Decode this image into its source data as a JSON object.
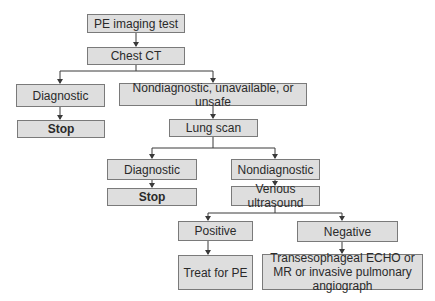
{
  "diagram": {
    "colors": {
      "box_fill": "#dedede",
      "box_border": "#7a7a7a",
      "line": "#3a3a3a",
      "text": "#2a2a2a"
    },
    "nodes": {
      "pe_imaging_test": "PE imaging test",
      "chest_ct": "Chest CT",
      "ct_diagnostic": "Diagnostic",
      "ct_nondiagnostic": "Nondiagnostic, unavailable, or unsafe",
      "ct_stop": "Stop",
      "lung_scan": "Lung scan",
      "ls_diagnostic": "Diagnostic",
      "ls_nondiagnostic": "Nondiagnostic",
      "ls_stop": "Stop",
      "venous_ultrasound": "Venous ultrasound",
      "vu_positive": "Positive",
      "vu_negative": "Negative",
      "treat_for_pe": "Treat for PE",
      "further_imaging": "Transesophageal ECHO or MR or invasive pulmonary angiograph"
    },
    "edges": [
      [
        "pe_imaging_test",
        "chest_ct"
      ],
      [
        "chest_ct",
        "ct_diagnostic"
      ],
      [
        "chest_ct",
        "ct_nondiagnostic"
      ],
      [
        "ct_diagnostic",
        "ct_stop"
      ],
      [
        "ct_nondiagnostic",
        "lung_scan"
      ],
      [
        "lung_scan",
        "ls_diagnostic"
      ],
      [
        "lung_scan",
        "ls_nondiagnostic"
      ],
      [
        "ls_diagnostic",
        "ls_stop"
      ],
      [
        "ls_nondiagnostic",
        "venous_ultrasound"
      ],
      [
        "venous_ultrasound",
        "vu_positive"
      ],
      [
        "venous_ultrasound",
        "vu_negative"
      ],
      [
        "vu_positive",
        "treat_for_pe"
      ],
      [
        "vu_negative",
        "further_imaging"
      ]
    ]
  }
}
